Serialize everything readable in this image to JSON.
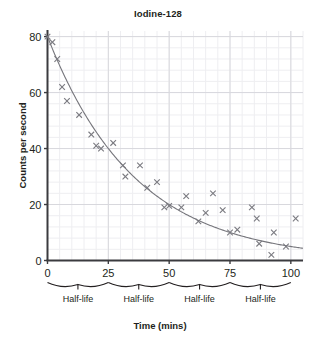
{
  "chart_data": {
    "type": "scatter",
    "title": "Iodine-128",
    "xlabel": "Time (mins)",
    "ylabel": "Counts per second",
    "xlim": [
      0,
      105
    ],
    "ylim": [
      0,
      82
    ],
    "xticks": [
      0,
      25,
      50,
      75,
      100
    ],
    "yticks": [
      0,
      20,
      40,
      60,
      80
    ],
    "grid": true,
    "grid_minor": true,
    "legend": "none",
    "series": [
      {
        "name": "Measured counts",
        "marker": "x",
        "color": "#7a7a80",
        "points": [
          [
            0,
            80
          ],
          [
            2,
            78
          ],
          [
            4,
            72
          ],
          [
            6,
            62
          ],
          [
            8,
            57
          ],
          [
            13,
            52
          ],
          [
            18,
            45
          ],
          [
            20,
            41
          ],
          [
            22,
            40
          ],
          [
            27,
            42
          ],
          [
            31,
            34
          ],
          [
            32,
            30
          ],
          [
            38,
            34
          ],
          [
            41,
            26
          ],
          [
            45,
            28
          ],
          [
            48,
            19
          ],
          [
            50,
            19.5
          ],
          [
            55,
            19
          ],
          [
            57,
            23
          ],
          [
            62,
            14
          ],
          [
            65,
            17
          ],
          [
            68,
            24
          ],
          [
            72,
            18
          ],
          [
            75,
            10
          ],
          [
            78,
            11
          ],
          [
            84,
            19
          ],
          [
            86,
            15
          ],
          [
            87,
            6
          ],
          [
            92,
            2
          ],
          [
            93,
            10
          ],
          [
            98,
            5
          ],
          [
            102,
            15
          ]
        ]
      }
    ],
    "fit_curve": {
      "name": "Exponential decay best-fit",
      "type": "exponential",
      "initial_value": 80,
      "half_life": 25,
      "color": "#76767c"
    },
    "annotations": [
      {
        "label": "Half-life",
        "from": 0,
        "to": 25
      },
      {
        "label": "Half-life",
        "from": 25,
        "to": 50
      },
      {
        "label": "Half-life",
        "from": 50,
        "to": 75
      },
      {
        "label": "Half-life",
        "from": 75,
        "to": 100
      }
    ]
  },
  "axes": {
    "x_tick_labels": [
      "0",
      "25",
      "50",
      "75",
      "100"
    ],
    "y_tick_labels": [
      "0",
      "20",
      "40",
      "60",
      "80"
    ]
  },
  "colors": {
    "axis": "#3b3b3f",
    "grid_major": "#d8d8dd",
    "grid_minor": "#eeeef1",
    "marker": "#7a7a80",
    "curve": "#76767c",
    "text": "#231f20",
    "background": "#ffffff"
  }
}
